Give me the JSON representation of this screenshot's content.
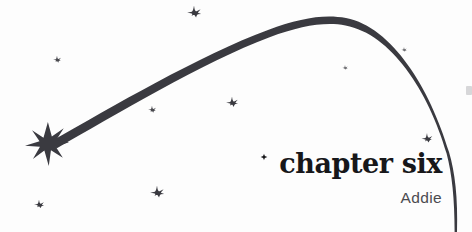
{
  "page": {
    "background_color": "#fdfdfd",
    "width": 472,
    "height": 232
  },
  "title_block": {
    "chapter_title": "chapter six",
    "subtitle": "Addie",
    "title_color": "#17171a",
    "subtitle_color": "#4b4b50"
  },
  "artwork": {
    "ink_color": "#3a3a40",
    "comet": {
      "name": "comet-arc",
      "description": "tapered shooting-star trail arcing from lower-left burst up over the top and down off the lower right",
      "start": [
        52,
        143
      ],
      "apex": [
        325,
        17
      ],
      "end": [
        455,
        232
      ],
      "thickest_width": 7,
      "thinnest_width": 0.7
    },
    "burst": {
      "name": "starburst",
      "center": [
        47,
        144
      ],
      "radius": 22,
      "points": 8
    },
    "stars": [
      {
        "name": "star-top-center",
        "x": 194,
        "y": 13,
        "size": 15,
        "opacity": 1.0
      },
      {
        "name": "star-upper-left",
        "x": 57,
        "y": 60,
        "size": 9,
        "opacity": 0.92
      },
      {
        "name": "star-mid-left",
        "x": 152,
        "y": 110,
        "size": 9,
        "opacity": 0.92
      },
      {
        "name": "star-mid-center",
        "x": 232,
        "y": 103,
        "size": 13,
        "opacity": 1.0
      },
      {
        "name": "star-upper-right",
        "x": 345,
        "y": 68,
        "size": 6,
        "opacity": 0.78
      },
      {
        "name": "star-arc-right",
        "x": 404,
        "y": 50,
        "size": 6,
        "opacity": 0.78
      },
      {
        "name": "star-right",
        "x": 427,
        "y": 139,
        "size": 12,
        "opacity": 1.0
      },
      {
        "name": "star-bottom-left",
        "x": 39,
        "y": 205,
        "size": 11,
        "opacity": 1.0
      },
      {
        "name": "star-bottom-center",
        "x": 157,
        "y": 193,
        "size": 15,
        "opacity": 1.0
      }
    ],
    "title_sparkle": {
      "name": "sparkle",
      "x": 264,
      "y": 157,
      "size": 7
    }
  }
}
